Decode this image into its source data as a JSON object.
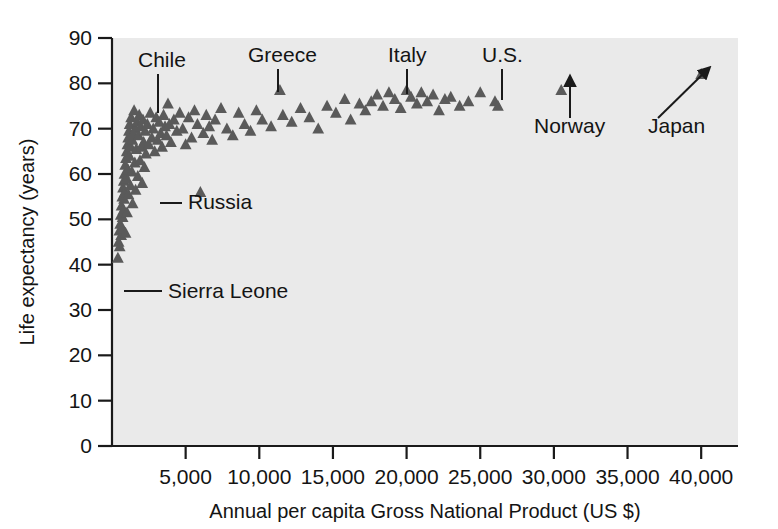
{
  "chart_data": {
    "type": "scatter",
    "title": "",
    "xlabel": "Annual per capita Gross National Product (US $)",
    "ylabel": "Life expectancy (years)",
    "xlim": [
      0,
      42500
    ],
    "ylim": [
      0,
      90
    ],
    "xticks": [
      5000,
      10000,
      15000,
      20000,
      25000,
      30000,
      35000,
      40000
    ],
    "xtick_labels": [
      "5,000",
      "10,000",
      "15,000",
      "20,000",
      "25,000",
      "30,000",
      "35,000",
      "40,000"
    ],
    "yticks": [
      0,
      10,
      20,
      30,
      40,
      50,
      60,
      70,
      80,
      90
    ],
    "ytick_labels": [
      "0",
      "10",
      "20",
      "30",
      "40",
      "50",
      "60",
      "70",
      "80",
      "90"
    ],
    "grid": false,
    "legend": "none",
    "marker": "triangle",
    "marker_color": "#5a5a5a",
    "plot_background": "#eaeaea",
    "points": [
      [
        400,
        41.5
      ],
      [
        450,
        45.0
      ],
      [
        500,
        47.5
      ],
      [
        520,
        44.0
      ],
      [
        560,
        49.0
      ],
      [
        600,
        51.0
      ],
      [
        620,
        46.5
      ],
      [
        650,
        53.0
      ],
      [
        680,
        48.0
      ],
      [
        700,
        55.0
      ],
      [
        720,
        50.5
      ],
      [
        750,
        57.0
      ],
      [
        780,
        52.0
      ],
      [
        800,
        58.5
      ],
      [
        820,
        54.5
      ],
      [
        850,
        60.0
      ],
      [
        870,
        56.0
      ],
      [
        900,
        62.0
      ],
      [
        920,
        47.0
      ],
      [
        950,
        63.5
      ],
      [
        980,
        59.0
      ],
      [
        1000,
        65.0
      ],
      [
        1020,
        51.5
      ],
      [
        1050,
        66.5
      ],
      [
        1080,
        61.0
      ],
      [
        1100,
        68.0
      ],
      [
        1120,
        55.5
      ],
      [
        1150,
        69.5
      ],
      [
        1180,
        64.0
      ],
      [
        1200,
        71.0
      ],
      [
        1250,
        57.5
      ],
      [
        1280,
        66.0
      ],
      [
        1300,
        72.5
      ],
      [
        1350,
        60.5
      ],
      [
        1380,
        67.5
      ],
      [
        1400,
        53.5
      ],
      [
        1450,
        69.0
      ],
      [
        1500,
        74.0
      ],
      [
        1550,
        62.5
      ],
      [
        1580,
        70.0
      ],
      [
        1600,
        56.5
      ],
      [
        1650,
        65.5
      ],
      [
        1700,
        71.5
      ],
      [
        1750,
        59.5
      ],
      [
        1800,
        68.5
      ],
      [
        1850,
        73.0
      ],
      [
        1900,
        63.0
      ],
      [
        1950,
        70.5
      ],
      [
        2000,
        66.0
      ],
      [
        2050,
        58.0
      ],
      [
        2100,
        72.0
      ],
      [
        2150,
        67.0
      ],
      [
        2200,
        61.5
      ],
      [
        2250,
        69.5
      ],
      [
        2300,
        64.5
      ],
      [
        2400,
        71.0
      ],
      [
        2500,
        66.5
      ],
      [
        2600,
        73.5
      ],
      [
        2700,
        68.0
      ],
      [
        2800,
        70.0
      ],
      [
        2900,
        65.0
      ],
      [
        3000,
        72.5
      ],
      [
        3100,
        67.5
      ],
      [
        3200,
        71.5
      ],
      [
        3300,
        69.0
      ],
      [
        3400,
        66.0
      ],
      [
        3500,
        73.0
      ],
      [
        3600,
        70.5
      ],
      [
        3700,
        68.5
      ],
      [
        3800,
        75.5
      ],
      [
        3900,
        71.0
      ],
      [
        4000,
        67.0
      ],
      [
        4200,
        72.0
      ],
      [
        4400,
        69.5
      ],
      [
        4600,
        73.5
      ],
      [
        4800,
        70.0
      ],
      [
        5000,
        66.5
      ],
      [
        5200,
        72.5
      ],
      [
        5400,
        68.0
      ],
      [
        5600,
        74.0
      ],
      [
        5800,
        71.0
      ],
      [
        6000,
        56.0
      ],
      [
        6200,
        69.0
      ],
      [
        6400,
        73.0
      ],
      [
        6600,
        70.5
      ],
      [
        6800,
        67.5
      ],
      [
        7000,
        72.0
      ],
      [
        7400,
        74.5
      ],
      [
        7800,
        70.0
      ],
      [
        8200,
        68.5
      ],
      [
        8600,
        73.5
      ],
      [
        9000,
        71.0
      ],
      [
        9400,
        69.5
      ],
      [
        9800,
        74.0
      ],
      [
        10200,
        72.0
      ],
      [
        10800,
        70.5
      ],
      [
        11400,
        78.5
      ],
      [
        11600,
        73.0
      ],
      [
        12200,
        71.5
      ],
      [
        12800,
        74.5
      ],
      [
        13400,
        72.5
      ],
      [
        14000,
        70.0
      ],
      [
        14600,
        75.0
      ],
      [
        15200,
        73.5
      ],
      [
        15800,
        76.5
      ],
      [
        16200,
        72.0
      ],
      [
        16800,
        75.5
      ],
      [
        17200,
        74.0
      ],
      [
        17600,
        76.0
      ],
      [
        18000,
        77.5
      ],
      [
        18400,
        75.0
      ],
      [
        18800,
        78.0
      ],
      [
        19200,
        76.5
      ],
      [
        19600,
        74.5
      ],
      [
        20000,
        78.5
      ],
      [
        20300,
        77.0
      ],
      [
        20700,
        75.5
      ],
      [
        21000,
        78.0
      ],
      [
        21400,
        76.0
      ],
      [
        21800,
        77.5
      ],
      [
        22200,
        74.0
      ],
      [
        22600,
        76.5
      ],
      [
        23000,
        77.0
      ],
      [
        23600,
        75.0
      ],
      [
        24200,
        76.0
      ],
      [
        25000,
        78.0
      ],
      [
        26000,
        76.0
      ],
      [
        26200,
        75.0
      ],
      [
        30500,
        78.5
      ],
      [
        40000,
        82.0
      ]
    ],
    "annotations": [
      {
        "label": "Chile",
        "label_x": 138,
        "label_y": 67,
        "arrow": "line",
        "from_x": 158,
        "from_y": 74,
        "to_x": 158,
        "to_y": 113
      },
      {
        "label": "Greece",
        "label_x": 248,
        "label_y": 62,
        "arrow": "line",
        "from_x": 278,
        "from_y": 69,
        "to_x": 278,
        "to_y": 92
      },
      {
        "label": "Italy",
        "label_x": 388,
        "label_y": 62,
        "arrow": "line",
        "from_x": 407,
        "from_y": 69,
        "to_x": 407,
        "to_y": 94
      },
      {
        "label": "Russia",
        "label_x": 188,
        "label_y": 209,
        "arrow": "line",
        "from_x": 182,
        "from_y": 203,
        "to_x": 160,
        "to_y": 203
      },
      {
        "label": "Sierra Leone",
        "label_x": 168,
        "label_y": 298,
        "arrow": "line",
        "from_x": 162,
        "from_y": 291,
        "to_x": 124,
        "to_y": 291
      },
      {
        "label": "U.S.",
        "label_x": 482,
        "label_y": 62,
        "arrow": "line",
        "from_x": 502,
        "from_y": 69,
        "to_x": 502,
        "to_y": 100
      },
      {
        "label": "Norway",
        "label_x": 534,
        "label_y": 133,
        "arrow": "arrow",
        "from_x": 570,
        "from_y": 118,
        "to_x": 570,
        "to_y": 81
      },
      {
        "label": "Japan",
        "label_x": 648,
        "label_y": 133,
        "arrow": "arrow",
        "from_x": 658,
        "from_y": 118,
        "to_x": 706,
        "to_y": 71
      }
    ]
  }
}
